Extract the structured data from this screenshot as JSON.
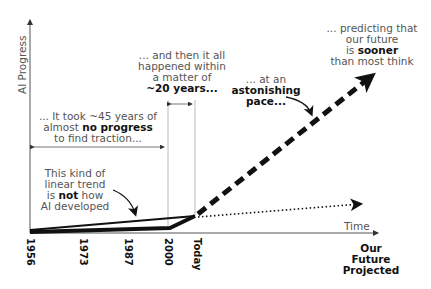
{
  "axes": {
    "y_label": "AI Progress",
    "x_label": "Time",
    "x_ticks": [
      "1956",
      "1973",
      "1987",
      "2000",
      "Today"
    ],
    "x_end_label_lines": [
      "Our",
      "Future",
      "Projected"
    ]
  },
  "annotations": {
    "no_progress": {
      "line1": "... It took ~45 years of",
      "line2_pre": "almost ",
      "line2_bold": "no progress",
      "line3": "to find traction..."
    },
    "twenty_years": {
      "line1": "... and then it all",
      "line2": "happened within",
      "line3": "a matter of",
      "line4_bold": "~20 years..."
    },
    "pace": {
      "line1": "... at an",
      "line2_bold": "astonishing",
      "line3_bold": "pace..."
    },
    "prediction": {
      "line1": "... predicting that",
      "line2": "our future",
      "line3_pre": "is ",
      "line3_bold": "sooner",
      "line4": "than most think"
    },
    "linear": {
      "line1": "This kind of",
      "line2": "linear trend",
      "line3_pre": "is ",
      "line3_bold": "not",
      "line3_post": " how",
      "line4": "AI developed"
    }
  },
  "series": [
    {
      "name": "linear-trend",
      "style": "solid-thin",
      "points": [
        [
          1956,
          0
        ],
        [
          2023,
          1
        ]
      ]
    },
    {
      "name": "actual-progress",
      "style": "solid-thick",
      "points": [
        [
          1956,
          0
        ],
        [
          2000,
          0.3
        ],
        [
          2023,
          1
        ]
      ]
    },
    {
      "name": "linear-projection",
      "style": "dotted",
      "direction": "future"
    },
    {
      "name": "exponential-projection",
      "style": "dashed-thick",
      "direction": "future"
    }
  ],
  "colors": {
    "ink": "#111111",
    "text": "#555555",
    "guide": "#999999",
    "background": "#ffffff"
  }
}
